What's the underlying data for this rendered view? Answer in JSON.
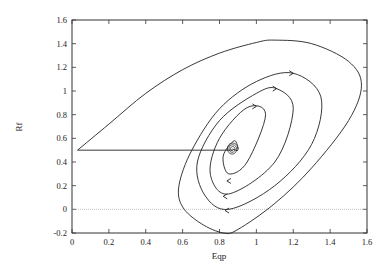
{
  "chart_data": {
    "type": "line",
    "title": "",
    "xlabel": "Eqp",
    "ylabel": "Rf",
    "xlim": [
      0,
      1.6
    ],
    "ylim": [
      -0.2,
      1.6
    ],
    "x_ticks": [
      "0",
      "0.2",
      "0.4",
      "0.6",
      "0.8",
      "1",
      "1.2",
      "1.4",
      "1.6"
    ],
    "y_ticks": [
      "-0.2",
      "0",
      "0.2",
      "0.4",
      "0.6",
      "0.8",
      "1",
      "1.2",
      "1.4",
      "1.6"
    ],
    "grid": false,
    "legend": null,
    "reference_line": {
      "y": 0,
      "style": "dotted"
    },
    "series": [
      {
        "name": "phase trajectory (spiral to equilibrium)",
        "description": "Starts at (0.03, 0.5), rises to outer loop peaking near (1.08, 1.43), right extreme near (1.57, 1.05), bottom near (0.82, -0.2), spirals inward counter-clockwise to equilibrium near (0.87, 0.51)",
        "x": [
          0.03,
          0.2,
          0.4,
          0.6,
          0.8,
          1.0,
          1.1,
          1.3,
          1.5,
          1.57,
          1.5,
          1.3,
          1.1,
          0.9,
          0.82,
          0.7,
          0.6,
          0.58,
          0.65,
          0.8,
          1.0,
          1.2,
          1.35,
          1.3,
          1.1,
          0.85,
          0.72,
          0.68,
          0.8,
          1.0,
          1.11,
          1.2,
          1.1,
          0.85,
          0.75,
          0.8,
          0.95,
          1.05,
          0.95,
          0.85,
          0.82,
          0.88,
          0.9,
          0.87
        ],
        "y": [
          0.5,
          0.72,
          0.98,
          1.18,
          1.32,
          1.41,
          1.43,
          1.4,
          1.25,
          1.05,
          0.75,
          0.35,
          0.05,
          -0.17,
          -0.2,
          -0.12,
          0.02,
          0.2,
          0.5,
          0.85,
          1.08,
          1.15,
          0.95,
          0.55,
          0.2,
          0.0,
          0.12,
          0.4,
          0.75,
          0.98,
          1.02,
          0.85,
          0.4,
          0.13,
          0.3,
          0.6,
          0.86,
          0.8,
          0.4,
          0.3,
          0.45,
          0.58,
          0.5,
          0.51
        ]
      },
      {
        "name": "initial jump",
        "description": "Horizontal segment from start point to equilibrium region",
        "x": [
          0.03,
          0.87
        ],
        "y": [
          0.5,
          0.5
        ]
      }
    ],
    "arrows": [
      {
        "x": 1.2,
        "y": 1.15,
        "direction": "right"
      },
      {
        "x": 1.11,
        "y": 1.02,
        "direction": "right"
      },
      {
        "x": 1.0,
        "y": 0.87,
        "direction": "right"
      },
      {
        "x": 0.84,
        "y": 0.24,
        "direction": "left"
      },
      {
        "x": 0.82,
        "y": 0.11,
        "direction": "left"
      },
      {
        "x": 0.83,
        "y": -0.01,
        "direction": "left"
      }
    ]
  }
}
